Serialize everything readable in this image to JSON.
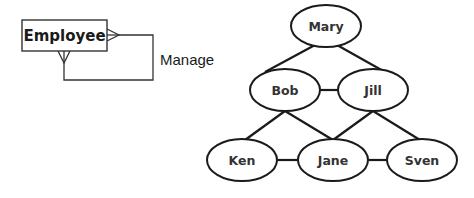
{
  "er_diagram": {
    "entity": {
      "name": "Employee"
    },
    "relationship": {
      "name": "Manage",
      "type": "recursive-many-to-many"
    }
  },
  "graph": {
    "nodes": [
      {
        "id": "mary",
        "label": "Mary",
        "cx": 326,
        "cy": 26
      },
      {
        "id": "bob",
        "label": "Bob",
        "cx": 285,
        "cy": 90
      },
      {
        "id": "jill",
        "label": "Jill",
        "cx": 373,
        "cy": 90
      },
      {
        "id": "ken",
        "label": "Ken",
        "cx": 242,
        "cy": 160
      },
      {
        "id": "jane",
        "label": "Jane",
        "cx": 333,
        "cy": 160
      },
      {
        "id": "sven",
        "label": "Sven",
        "cx": 422,
        "cy": 160
      }
    ],
    "edges": [
      [
        "mary",
        "bob"
      ],
      [
        "mary",
        "jill"
      ],
      [
        "bob",
        "jill"
      ],
      [
        "bob",
        "ken"
      ],
      [
        "bob",
        "jane"
      ],
      [
        "jill",
        "jane"
      ],
      [
        "jill",
        "sven"
      ],
      [
        "ken",
        "jane"
      ],
      [
        "jane",
        "sven"
      ]
    ]
  }
}
